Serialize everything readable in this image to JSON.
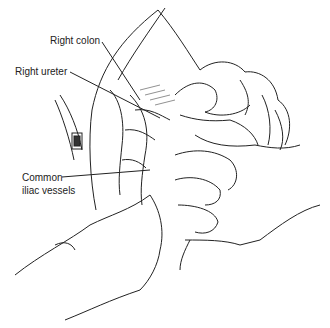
{
  "figure": {
    "type": "surgical illustration",
    "labels": [
      {
        "id": "right-colon",
        "text": "Right colon",
        "x": 50,
        "y": 35
      },
      {
        "id": "right-ureter",
        "text": "Right ureter",
        "x": 15,
        "y": 66
      },
      {
        "id": "common-iliac-1",
        "text": "Common",
        "x": 22,
        "y": 175
      },
      {
        "id": "common-iliac-2",
        "text": "iliac vessels",
        "x": 22,
        "y": 188
      }
    ]
  }
}
